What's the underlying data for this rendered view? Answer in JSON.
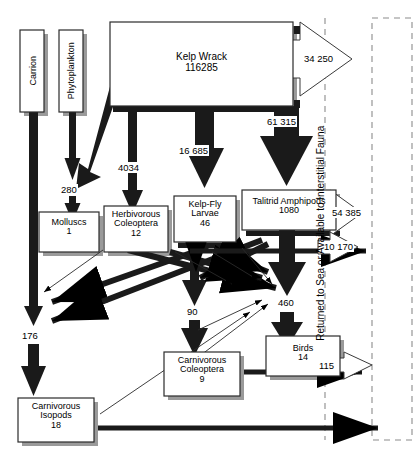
{
  "diagram": {
    "boundary_label": "Returned to Sea or Available to Interstitial Fauna",
    "colors": {
      "stroke": "#000000",
      "box_fill": "#ffffff",
      "shadow": "#9a9a9a",
      "dashed": "#8c8c8c"
    }
  },
  "nodes": [
    {
      "id": "carrion",
      "name": "Carrion",
      "value": "",
      "orientation": "vertical"
    },
    {
      "id": "phytoplankton",
      "name": "Phytoplankton",
      "value": "",
      "orientation": "vertical"
    },
    {
      "id": "kelp_wrack",
      "name": "Kelp Wrack",
      "value": "116285",
      "orientation": "horizontal"
    },
    {
      "id": "molluscs",
      "name": "Molluscs",
      "value": "1",
      "orientation": "horizontal"
    },
    {
      "id": "herb_coleo",
      "name": "Herbivorous Coleoptera",
      "value": "12",
      "orientation": "horizontal"
    },
    {
      "id": "kelp_fly",
      "name": "Kelp-Fly Larvae",
      "value": "46",
      "orientation": "horizontal"
    },
    {
      "id": "talitrid",
      "name": "Talitrid Amphipods",
      "value": "1080",
      "orientation": "horizontal"
    },
    {
      "id": "carn_coleo",
      "name": "Carnivorous Coleoptera",
      "value": "9",
      "orientation": "horizontal"
    },
    {
      "id": "birds",
      "name": "Birds",
      "value": "14",
      "orientation": "horizontal"
    },
    {
      "id": "carn_isopods",
      "name": "Carnivorous Isopods",
      "value": "18",
      "orientation": "horizontal"
    }
  ],
  "flow_labels": {
    "phyto_to_molluscs": "280",
    "wrack_to_herb": "4034",
    "wrack_to_kelpfly": "16 685",
    "wrack_to_talitrid": "61 315",
    "wrack_returned": "34 250",
    "talitrid_returned": "54 385",
    "talitrid_returned_2": "10 170",
    "carrion_to_isopods": "176",
    "to_carn_coleoptera": "90",
    "to_birds": "460",
    "birds_returned": "115"
  }
}
